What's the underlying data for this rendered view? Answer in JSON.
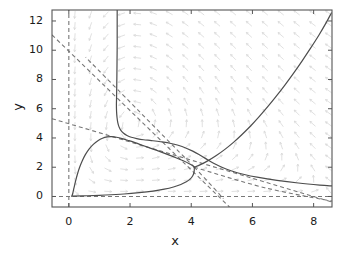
{
  "chart_data": {
    "type": "line",
    "title": "",
    "subtitle": "",
    "xlabel": "x",
    "ylabel": "y",
    "xlim": [
      -0.55,
      8.6
    ],
    "ylim": [
      -0.72,
      12.75
    ],
    "xticks": [
      0,
      2,
      4,
      6,
      8
    ],
    "xtick_labels": [
      "0",
      "2",
      "4",
      "6",
      "8"
    ],
    "yticks": [
      0,
      2,
      4,
      6,
      8,
      10,
      12
    ],
    "ytick_labels": [
      "0",
      "2",
      "4",
      "6",
      "8",
      "10",
      "12"
    ],
    "grid": false,
    "legend": "none",
    "background": "#ffffff",
    "axis_color": "#555555",
    "curve_color": "#4d4d4d",
    "dash_color": "#777777",
    "quiver_color": "#d8d8d8",
    "annotations": [
      {
        "label": "saddle-point",
        "x": 4.1,
        "y": 2.0
      },
      {
        "label": "trajectory-peak",
        "x": 1.3,
        "y": 4.08
      }
    ],
    "quiver": {
      "description": "light gray direction-field arrows on a regular grid",
      "x_start": 0.2,
      "x_step": 0.52,
      "x_count": 17,
      "y_start": 0.35,
      "y_step": 0.76,
      "y_count": 17
    },
    "series": [
      {
        "name": "trajectory-lower-left-rise",
        "style": "solid",
        "points": [
          [
            0.1,
            0.02
          ],
          [
            0.13,
            0.22
          ],
          [
            0.17,
            0.6
          ],
          [
            0.22,
            1.05
          ],
          [
            0.28,
            1.52
          ],
          [
            0.35,
            1.98
          ],
          [
            0.44,
            2.44
          ],
          [
            0.54,
            2.86
          ],
          [
            0.66,
            3.24
          ],
          [
            0.8,
            3.56
          ],
          [
            0.95,
            3.81
          ],
          [
            1.1,
            3.98
          ],
          [
            1.25,
            4.07
          ],
          [
            1.4,
            4.09
          ],
          [
            1.56,
            4.05
          ],
          [
            1.74,
            3.96
          ],
          [
            1.94,
            3.83
          ],
          [
            2.16,
            3.68
          ],
          [
            2.4,
            3.5
          ],
          [
            2.66,
            3.31
          ],
          [
            2.94,
            3.1
          ],
          [
            3.22,
            2.88
          ],
          [
            3.5,
            2.65
          ],
          [
            3.74,
            2.44
          ],
          [
            3.92,
            2.26
          ],
          [
            4.04,
            2.11
          ],
          [
            4.1,
            2.0
          ]
        ]
      },
      {
        "name": "trajectory-upper-descent",
        "style": "solid",
        "points": [
          [
            1.58,
            12.75
          ],
          [
            1.58,
            11.6
          ],
          [
            1.58,
            10.4
          ],
          [
            1.575,
            9.2
          ],
          [
            1.57,
            8.2
          ],
          [
            1.565,
            7.4
          ],
          [
            1.56,
            6.8
          ],
          [
            1.555,
            6.25
          ],
          [
            1.56,
            5.8
          ],
          [
            1.575,
            5.4
          ],
          [
            1.6,
            5.05
          ],
          [
            1.64,
            4.76
          ],
          [
            1.7,
            4.52
          ],
          [
            1.79,
            4.32
          ],
          [
            1.9,
            4.17
          ],
          [
            2.04,
            4.05
          ],
          [
            2.22,
            3.96
          ],
          [
            2.44,
            3.88
          ],
          [
            2.7,
            3.82
          ],
          [
            3.0,
            3.74
          ],
          [
            3.34,
            3.62
          ],
          [
            3.7,
            3.42
          ],
          [
            4.05,
            3.1
          ],
          [
            4.32,
            2.78
          ],
          [
            4.56,
            2.48
          ],
          [
            4.78,
            2.22
          ],
          [
            5.0,
            2.0
          ],
          [
            5.3,
            1.76
          ],
          [
            5.7,
            1.52
          ],
          [
            6.2,
            1.3
          ],
          [
            6.8,
            1.1
          ],
          [
            7.5,
            0.92
          ],
          [
            8.2,
            0.78
          ],
          [
            8.6,
            0.72
          ]
        ]
      },
      {
        "name": "trajectory-lower-axis-to-saddle",
        "style": "solid",
        "points": [
          [
            0.1,
            0.02
          ],
          [
            0.6,
            0.05
          ],
          [
            1.2,
            0.1
          ],
          [
            1.8,
            0.17
          ],
          [
            2.3,
            0.26
          ],
          [
            2.75,
            0.37
          ],
          [
            3.12,
            0.5
          ],
          [
            3.42,
            0.65
          ],
          [
            3.66,
            0.82
          ],
          [
            3.84,
            1.0
          ],
          [
            3.97,
            1.2
          ],
          [
            4.05,
            1.42
          ],
          [
            4.09,
            1.64
          ],
          [
            4.1,
            1.85
          ],
          [
            4.1,
            2.0
          ]
        ]
      },
      {
        "name": "trajectory-right-ascent",
        "style": "solid",
        "points": [
          [
            4.1,
            2.0
          ],
          [
            4.3,
            2.18
          ],
          [
            4.55,
            2.45
          ],
          [
            4.82,
            2.8
          ],
          [
            5.1,
            3.22
          ],
          [
            5.38,
            3.7
          ],
          [
            5.66,
            4.24
          ],
          [
            5.94,
            4.82
          ],
          [
            6.22,
            5.46
          ],
          [
            6.5,
            6.14
          ],
          [
            6.78,
            6.86
          ],
          [
            7.06,
            7.62
          ],
          [
            7.34,
            8.42
          ],
          [
            7.62,
            9.26
          ],
          [
            7.9,
            10.14
          ],
          [
            8.18,
            11.06
          ],
          [
            8.42,
            11.92
          ],
          [
            8.58,
            12.55
          ]
        ]
      }
    ],
    "nullclines": [
      {
        "name": "nullcline-vertical-x0",
        "style": "dashed",
        "points": [
          [
            0.0,
            -0.72
          ],
          [
            0.0,
            12.75
          ]
        ]
      },
      {
        "name": "nullcline-horizontal-y0",
        "style": "dashed",
        "points": [
          [
            -0.55,
            0.0
          ],
          [
            8.6,
            0.0
          ]
        ]
      },
      {
        "name": "nullcline-steep-descending",
        "style": "dashed",
        "points": [
          [
            -0.55,
            11.05
          ],
          [
            5.25,
            -0.72
          ]
        ]
      },
      {
        "name": "nullcline-shallow-descending",
        "style": "dashed",
        "points": [
          [
            -0.55,
            5.32
          ],
          [
            8.6,
            -0.38
          ]
        ]
      },
      {
        "name": "separatrix-upper-left",
        "style": "dashed",
        "points": [
          [
            4.1,
            2.0
          ],
          [
            1.6,
            7.3
          ],
          [
            0.55,
            9.52
          ]
        ]
      },
      {
        "name": "separatrix-lower-right",
        "style": "dashed",
        "points": [
          [
            4.1,
            2.0
          ],
          [
            6.4,
            0.6
          ],
          [
            8.6,
            -0.32
          ]
        ]
      },
      {
        "name": "separatrix-lower-middle",
        "style": "dashed",
        "points": [
          [
            4.1,
            2.0
          ],
          [
            4.75,
            0.55
          ],
          [
            5.05,
            -0.15
          ]
        ]
      }
    ]
  },
  "axes": {
    "x_title": "x",
    "y_title": "y"
  }
}
